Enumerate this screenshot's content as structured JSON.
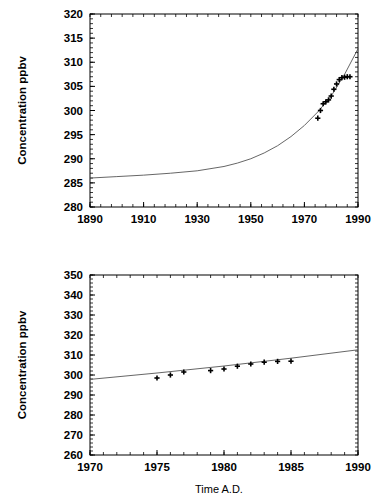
{
  "figure": {
    "background": "#ffffff",
    "line_color": "#555555",
    "marker_color": "#000000",
    "axis_color": "#000000",
    "xlabel_shared": "Time  A.D."
  },
  "chart_data": [
    {
      "type": "line",
      "panel": "top",
      "title": "",
      "xlabel": "",
      "ylabel": "Concentration ppbv",
      "xlim": [
        1890,
        1990
      ],
      "ylim": [
        280,
        320
      ],
      "xticks": [
        1890,
        1910,
        1930,
        1950,
        1970,
        1990
      ],
      "xtick_labels": [
        "1890",
        "1910",
        "1930",
        "1950",
        "1970",
        "1990"
      ],
      "yticks": [
        280,
        285,
        290,
        295,
        300,
        305,
        310,
        315,
        320
      ],
      "ytick_labels": [
        "280",
        "285",
        "290",
        "295",
        "300",
        "305",
        "310",
        "315",
        "320"
      ],
      "x_minor_step": 4,
      "y_minor_step": 1,
      "grid": false,
      "legend": "none",
      "series": [
        {
          "name": "model curve",
          "style": "line",
          "x": [
            1890,
            1900,
            1910,
            1920,
            1930,
            1940,
            1945,
            1950,
            1955,
            1960,
            1965,
            1970,
            1975,
            1980,
            1985,
            1990
          ],
          "y": [
            286.0,
            286.3,
            286.6,
            287.0,
            287.5,
            288.4,
            289.1,
            290.0,
            291.2,
            292.7,
            294.6,
            296.9,
            299.7,
            303.0,
            307.5,
            312.8
          ]
        },
        {
          "name": "observations",
          "style": "points",
          "marker": "plus",
          "x": [
            1975,
            1976,
            1977,
            1978,
            1979,
            1980,
            1981,
            1982,
            1983,
            1984,
            1985,
            1986,
            1987
          ],
          "y": [
            298.4,
            300.0,
            301.4,
            301.8,
            302.2,
            303.0,
            304.4,
            305.5,
            306.4,
            306.8,
            306.9,
            307.0,
            307.0
          ]
        }
      ]
    },
    {
      "type": "line",
      "panel": "bottom",
      "title": "",
      "xlabel": "Time  A.D.",
      "ylabel": "Concentration ppbv",
      "xlim": [
        1970,
        1990
      ],
      "ylim": [
        260,
        350
      ],
      "xticks": [
        1970,
        1975,
        1980,
        1985,
        1990
      ],
      "xtick_labels": [
        "1970",
        "1975",
        "1980",
        "1985",
        "1990"
      ],
      "yticks": [
        260,
        270,
        280,
        290,
        300,
        310,
        320,
        330,
        340,
        350
      ],
      "ytick_labels": [
        "260",
        "270",
        "280",
        "290",
        "300",
        "310",
        "320",
        "330",
        "340",
        "350"
      ],
      "x_minor_step": 1,
      "y_minor_step": 2,
      "grid": false,
      "legend": "none",
      "series": [
        {
          "name": "model curve",
          "style": "line",
          "x": [
            1970,
            1975,
            1980,
            1985,
            1990
          ],
          "y": [
            297.8,
            301.0,
            304.5,
            308.4,
            312.6
          ]
        },
        {
          "name": "observations",
          "style": "points",
          "marker": "plus",
          "x": [
            1975,
            1976,
            1977,
            1979,
            1980,
            1981,
            1982,
            1983,
            1984,
            1985
          ],
          "y": [
            298.5,
            300.0,
            301.5,
            302.2,
            303.0,
            304.4,
            305.5,
            306.4,
            306.8,
            306.9
          ]
        }
      ]
    }
  ]
}
